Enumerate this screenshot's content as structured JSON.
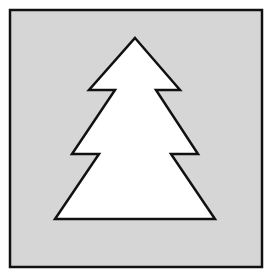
{
  "figure": {
    "colors": {
      "page_background": "#ffffff",
      "panel_fill": "#d6d6d6",
      "panel_border": "#111111",
      "tree_fill": "#ffffff",
      "tree_outline": "#111111"
    },
    "tiers": 3
  }
}
